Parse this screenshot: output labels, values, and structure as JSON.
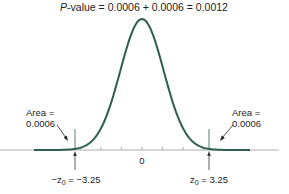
{
  "title": {
    "p_symbol": "P",
    "rest": "-value = 0.0006 + 0.0006 = 0.0012"
  },
  "left_area": {
    "line1": "Area =",
    "line2": "0.0006"
  },
  "right_area": {
    "line1": "Area =",
    "line2": "0.0006"
  },
  "axis": {
    "center_label": "0"
  },
  "left_cutoff": {
    "label_prefix": "−z",
    "subscript": "0",
    "label_suffix": " = −3.25"
  },
  "right_cutoff": {
    "label_prefix": "z",
    "subscript": "0",
    "label_suffix": " = 3.25"
  },
  "colors": {
    "curve": "#2f5e50",
    "shade": "#a9cfc5",
    "axis": "#888888"
  },
  "chart_data": {
    "type": "area",
    "title": "P-value = 0.0006 + 0.0006 = 0.0012",
    "distribution": "standard normal",
    "x_range": [
      -5,
      5
    ],
    "shaded_regions": [
      {
        "from": "-inf",
        "to": -3.25,
        "area": 0.0006
      },
      {
        "from": 3.25,
        "to": "inf",
        "area": 0.0006
      }
    ],
    "tick_labels": [
      "0"
    ],
    "cutoff_labels": [
      "-z0 = -3.25",
      "z0 = 3.25"
    ],
    "annotations": [
      "Area = 0.0006",
      "Area = 0.0006"
    ],
    "p_value": 0.0012
  }
}
